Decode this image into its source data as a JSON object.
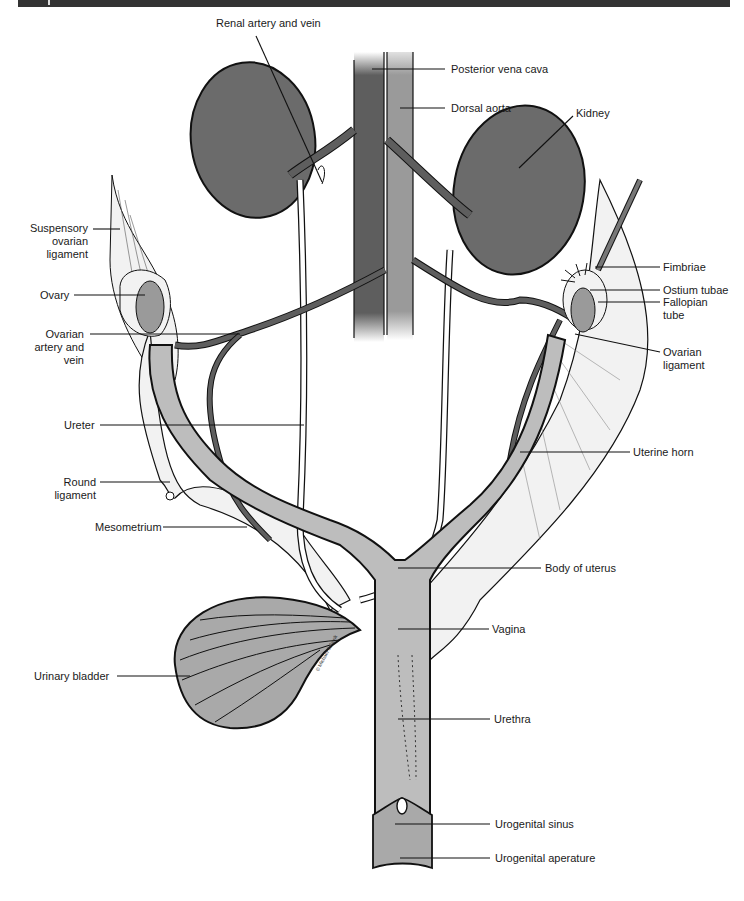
{
  "figure": {
    "colors": {
      "header_bar": "#333333",
      "kidney": "#6b6b6b",
      "vena_cava": "#5e5e5e",
      "aorta": "#9a9a9a",
      "uterus": "#bdbdbd",
      "bladder": "#a9a9a9",
      "ligament": "#f2f2f2",
      "outline": "#111111"
    },
    "watermark": "© Michael Schenk"
  },
  "labels": {
    "renal_artery_vein": "Renal artery and vein",
    "posterior_vena_cava": "Posterior vena cava",
    "dorsal_aorta": "Dorsal aorta",
    "kidney": "Kidney",
    "suspensory_ovarian_ligament": "Suspensory ovarian ligament",
    "ovary": "Ovary",
    "ovarian_artery_vein": "Ovarian artery and vein",
    "fimbriae": "Fimbriae",
    "ostium_tubae": "Ostium tubae",
    "fallopian_tube": "Fallopian tube",
    "ovarian_ligament": "Ovarian ligament",
    "ureter": "Ureter",
    "uterine_horn": "Uterine horn",
    "round_ligament": "Round ligament",
    "mesometrium": "Mesometrium",
    "body_of_uterus": "Body of uterus",
    "vagina": "Vagina",
    "urinary_bladder": "Urinary bladder",
    "urethra": "Urethra",
    "urogenital_sinus": "Urogenital sinus",
    "urogenital_aperature": "Urogenital aperature"
  }
}
